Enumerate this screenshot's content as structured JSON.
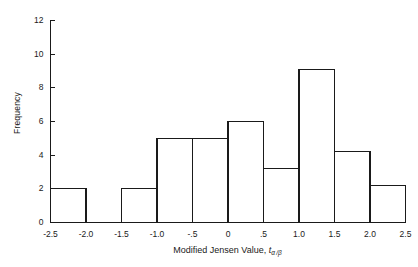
{
  "chart_data": {
    "type": "bar",
    "title": "",
    "subtitle": "",
    "xlabel": "Modified Jensen Value, t",
    "xlabel_italic_symbol": "t",
    "xlabel_subscript": "α /β",
    "ylabel": "Frequency",
    "xlim": [
      -2.5,
      2.5
    ],
    "ylim": [
      0,
      12
    ],
    "bin_width": 0.5,
    "grid": false,
    "legend": null,
    "xticks": [
      -2.5,
      -2.0,
      -1.5,
      -1.0,
      -0.5,
      0,
      0.5,
      1.0,
      1.5,
      2.0,
      2.5
    ],
    "xtick_labels": [
      "-2.5",
      "-2.0",
      "-1.5",
      "-1.0",
      "-.5",
      "0",
      ".5",
      "1.0",
      "1.5",
      "2.0",
      "2.5"
    ],
    "yticks": [
      0,
      2,
      4,
      6,
      8,
      10,
      12
    ],
    "ytick_labels": [
      "0",
      "2",
      "4",
      "6",
      "8",
      "10",
      "12"
    ],
    "bin_edges": [
      -2.5,
      -2.0,
      -1.5,
      -1.0,
      -0.5,
      0,
      0.5,
      1.0,
      1.5,
      2.0,
      2.5
    ],
    "categories": [
      "-2.5 to -2.0",
      "-2.0 to -1.5",
      "-1.5 to -1.0",
      "-1.0 to -0.5",
      "-0.5 to 0",
      "0 to 0.5",
      "0.5 to 1.0",
      "1.0 to 1.5",
      "1.5 to 2.0",
      "2.0 to 2.5"
    ],
    "values": [
      2.0,
      0.0,
      2.0,
      5.0,
      5.0,
      6.0,
      3.2,
      9.1,
      4.2,
      2.2
    ],
    "bar_fill": "#ffffff",
    "bar_stroke": "#1a1a1a",
    "axis_color": "#1a1a1a",
    "background": "#ffffff"
  }
}
